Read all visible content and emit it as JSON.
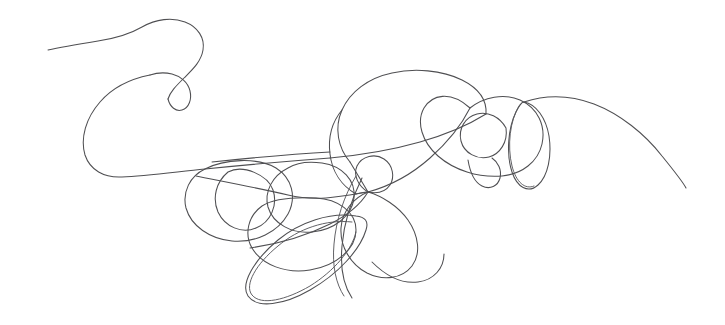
{
  "artwork": {
    "title": "Continuous line scribble",
    "medium": "pen drawing",
    "style": "single-stroke doodle",
    "background_color": "#ffffff",
    "stroke_color": "#4f4f52",
    "stroke_width_px": 1,
    "canvas": {
      "width": 725,
      "height": 325
    },
    "composition": {
      "start_point": [
        48,
        50
      ],
      "end_point": [
        686,
        188
      ],
      "bounding_box": {
        "x": 46,
        "y": 18,
        "width": 642,
        "height": 286
      },
      "density_center": [
        368,
        192
      ],
      "description": "A single unbroken pen line enters at the left, arcs over a small teardrop loop, sweeps down and left in a wide bowl, then winds through a dense cluster of overlapping tilted ellipses across the middle and lower center, passes through a major crossing node, forms concentric loops and a narrow vertical loop on the right, and exits as a long tapering arc toward the lower right."
    },
    "features": [
      {
        "name": "entry-tail",
        "kind": "open-arc",
        "anchor": [
          48,
          50
        ]
      },
      {
        "name": "upper-hook",
        "kind": "arc",
        "anchor": [
          130,
          28
        ]
      },
      {
        "name": "small-teardrop-loop",
        "kind": "closed-loop",
        "anchor": [
          165,
          96
        ]
      },
      {
        "name": "left-bowl-sweep",
        "kind": "wide-arc",
        "anchor": [
          96,
          150
        ]
      },
      {
        "name": "left-tilted-ellipse",
        "kind": "closed-loop",
        "anchor": [
          237,
          198
        ]
      },
      {
        "name": "left-inner-ellipse",
        "kind": "closed-loop",
        "anchor": [
          252,
          207
        ]
      },
      {
        "name": "mid-stacked-loops",
        "kind": "loop-cluster",
        "anchor": [
          300,
          205
        ]
      },
      {
        "name": "lower-long-ellipse",
        "kind": "closed-loop",
        "anchor": [
          310,
          250
        ]
      },
      {
        "name": "lower-doubled-edge",
        "kind": "parallel-pair",
        "anchor": [
          300,
          290
        ]
      },
      {
        "name": "central-crossing-node",
        "kind": "intersection",
        "anchor": [
          368,
          192
        ]
      },
      {
        "name": "tiny-circle-loop",
        "kind": "closed-loop",
        "anchor": [
          370,
          166
        ]
      },
      {
        "name": "central-petal-loop",
        "kind": "closed-loop",
        "anchor": [
          390,
          235
        ]
      },
      {
        "name": "top-center-arc",
        "kind": "arc",
        "anchor": [
          380,
          76
        ]
      },
      {
        "name": "right-outer-loop",
        "kind": "closed-loop",
        "anchor": [
          460,
          130
        ]
      },
      {
        "name": "right-inner-loop",
        "kind": "closed-loop",
        "anchor": [
          487,
          127
        ]
      },
      {
        "name": "narrow-vertical-loop",
        "kind": "closed-loop",
        "anchor": [
          534,
          135
        ]
      },
      {
        "name": "exit-tail",
        "kind": "open-arc",
        "anchor": [
          686,
          188
        ]
      }
    ]
  }
}
